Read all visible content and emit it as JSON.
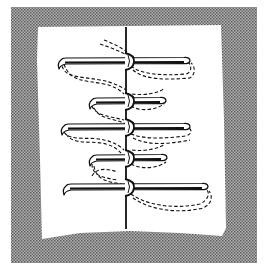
{
  "figure": {
    "title": "Stitch diagram",
    "colors": {
      "background": "#ffffff",
      "frame": "#9a9a9a",
      "frame_dot": "#5a5a5a",
      "panel": "#ffffff",
      "ink": "#111111"
    },
    "frame": {
      "x": 11,
      "y": 7,
      "width": 246,
      "height": 256
    },
    "panel_outline": "M38,27 L221,25 L224,120 L226,228 L222,236 L180,233 L130,231 L80,233 L42,239 L40,160 L37,60 Z",
    "center_line": {
      "x": 126,
      "y1": 27,
      "y2": 229
    },
    "stitches": [
      {
        "kind": "long",
        "y": 61,
        "x_left": 60,
        "x_right": 189
      },
      {
        "kind": "short",
        "y": 101,
        "x_left": 91,
        "x_right": 165
      },
      {
        "kind": "long",
        "y": 127,
        "x_left": 63,
        "x_right": 189
      },
      {
        "kind": "short",
        "y": 158,
        "x_left": 91,
        "x_right": 166
      },
      {
        "kind": "long",
        "y": 187,
        "x_left": 65,
        "x_right": 207
      }
    ],
    "dashed_threads": [
      "M100,44 C112,48 122,52 128,56",
      "M104,40 C114,44 122,48 127,52",
      "M62,66 C66,78 78,76 100,80 C112,82 120,86 126,90",
      "M64,64 C70,82 84,80 104,84 C114,86 120,90 124,94",
      "M131,66 C140,74 160,76 186,74 C192,72 192,66 188,62",
      "M133,70 C144,80 166,80 190,78 C196,74 195,66 191,63",
      "M92,106 C96,116 110,116 124,120",
      "M94,108 C100,120 114,118 126,124",
      "M131,106 C140,112 156,110 164,104",
      "M132,94 C146,96 162,92 164,88",
      "M64,132 C70,142 90,136 104,140 C114,142 120,146 124,150",
      "M66,134 C74,146 92,140 106,144 C114,146 118,150 122,154",
      "M131,134 C146,140 168,138 186,136 C192,134 192,130 189,128",
      "M133,138 C148,146 170,144 190,140",
      "M92,164 C92,176 104,178 118,180",
      "M94,166 C96,180 108,182 122,184",
      "M131,164 C142,170 158,168 166,162",
      "M132,150 C146,152 160,148 165,144",
      "M131,194 C144,204 172,210 200,204 C208,200 210,194 207,190",
      "M133,198 C150,210 178,214 203,208 C212,204 213,196 209,191",
      "M92,176 C96,168 106,168 118,172"
    ]
  }
}
